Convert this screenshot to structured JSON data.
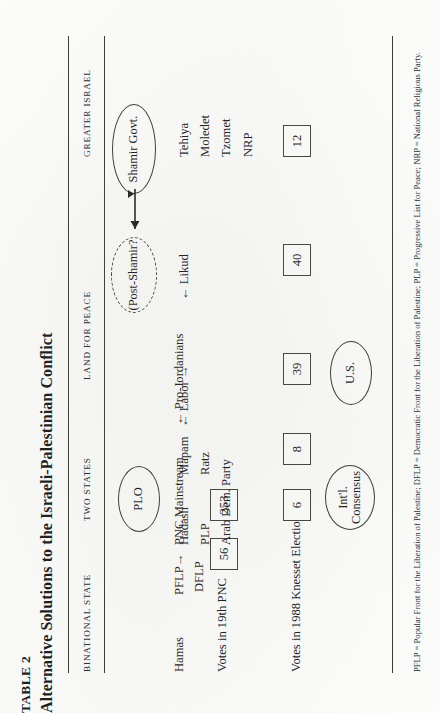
{
  "page": {
    "table_number": "TABLE 2",
    "title": "Alternative Solutions to the Israeli-Palestinian Conflict"
  },
  "columns": [
    {
      "key": "binational",
      "header": "BINATIONAL STATE"
    },
    {
      "key": "two_states",
      "header": "TWO STATES"
    },
    {
      "key": "land_for_peace",
      "header": "LAND FOR PEACE"
    },
    {
      "key": "greater_israel",
      "header": "GREATER ISRAEL"
    }
  ],
  "palestinian_side": {
    "row_label": "Votes in 19th PNC",
    "entries": [
      {
        "label": "Hamas"
      },
      {
        "label": "PFLP→"
      },
      {
        "label": "DFLP"
      },
      {
        "label": "PNC Mainstream"
      },
      {
        "label": "← Pro-Jordanians"
      }
    ],
    "votes": [
      {
        "value": "56"
      },
      {
        "value": "253"
      }
    ],
    "circle": {
      "label": "PLO"
    }
  },
  "israeli_side": {
    "row_label": "Votes in 1988 Knesset Elections",
    "entries": [
      {
        "label": "Hadash"
      },
      {
        "label": "PLP"
      },
      {
        "label": "Arab Dem. Party"
      },
      {
        "label": "Mapam"
      },
      {
        "label": "Ratz"
      },
      {
        "label": "← Labor →"
      },
      {
        "label": "← Likud"
      },
      {
        "label": "Tehiya"
      },
      {
        "label": "Moledet"
      },
      {
        "label": "Tzomet"
      },
      {
        "label": "NRP"
      }
    ],
    "votes": [
      {
        "value": "6"
      },
      {
        "value": "8"
      },
      {
        "value": "39"
      },
      {
        "value": "40"
      },
      {
        "value": "12"
      }
    ],
    "circles": [
      {
        "label": "Shamir Govt.",
        "style": "solid"
      },
      {
        "label": "(Post-Shamir?",
        "style": "dashed"
      }
    ]
  },
  "consensus_circles": [
    {
      "label_line1": "Int'l.",
      "label_line2": "Consensus"
    },
    {
      "label_line1": "U.S.",
      "label_line2": ""
    }
  ],
  "footnote": "PFLP = Popular Front for the Liberation of Palestine; DFLP = Democratic Front for the Liberation of Palestine; PLP = Progressive List for Peace; NRP = National Religious Party."
}
